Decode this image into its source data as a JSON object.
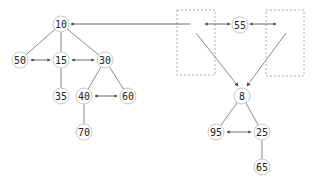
{
  "diagram": {
    "nodes": [
      {
        "id": "n10",
        "label": "10",
        "x": 61,
        "y": 24
      },
      {
        "id": "n50",
        "label": "50",
        "x": 20,
        "y": 60
      },
      {
        "id": "n15",
        "label": "15",
        "x": 61,
        "y": 60
      },
      {
        "id": "n30",
        "label": "30",
        "x": 105,
        "y": 60
      },
      {
        "id": "n35",
        "label": "35",
        "x": 61,
        "y": 96
      },
      {
        "id": "n40",
        "label": "40",
        "x": 84,
        "y": 96
      },
      {
        "id": "n60",
        "label": "60",
        "x": 128,
        "y": 96
      },
      {
        "id": "n70",
        "label": "70",
        "x": 84,
        "y": 132
      },
      {
        "id": "n55",
        "label": "55",
        "x": 240,
        "y": 25
      },
      {
        "id": "n8",
        "label": "8",
        "x": 242,
        "y": 96
      },
      {
        "id": "n95",
        "label": "95",
        "x": 216,
        "y": 132
      },
      {
        "id": "n25",
        "label": "25",
        "x": 262,
        "y": 132
      },
      {
        "id": "n65",
        "label": "65",
        "x": 262,
        "y": 167
      }
    ],
    "tree_edges": [
      [
        "n10",
        "n50"
      ],
      [
        "n10",
        "n15"
      ],
      [
        "n10",
        "n30"
      ],
      [
        "n15",
        "n35"
      ],
      [
        "n30",
        "n40"
      ],
      [
        "n30",
        "n60"
      ],
      [
        "n40",
        "n70"
      ],
      [
        "n8",
        "n95"
      ],
      [
        "n8",
        "n25"
      ],
      [
        "n25",
        "n65"
      ]
    ],
    "sibling_links": [
      [
        "n50",
        "n15"
      ],
      [
        "n15",
        "n30"
      ],
      [
        "n40",
        "n60"
      ],
      [
        "n95",
        "n25"
      ]
    ],
    "placeholder_boxes": [
      {
        "id": "left-empty-slot",
        "x": 177,
        "y": 10,
        "w": 38,
        "h": 65
      },
      {
        "id": "right-empty-slot",
        "x": 266,
        "y": 10,
        "w": 38,
        "h": 66
      }
    ],
    "colors": {
      "node_stroke": "#c8c8c8",
      "edge": "#8a8a8a",
      "arrow": "#444444",
      "box": "#9a9a9a"
    }
  }
}
